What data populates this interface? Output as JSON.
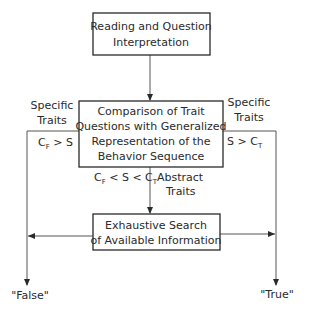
{
  "diagram": {
    "nodes": {
      "reading": {
        "lines": [
          "Reading and Question",
          "Interpretation"
        ]
      },
      "comparison": {
        "lines": [
          "Comparison of Trait",
          "Questions with Generalized",
          "Representation of the",
          "Behavior Sequence"
        ]
      },
      "search": {
        "lines": [
          "Exhaustive Search",
          "of Available Information"
        ]
      }
    },
    "branches": {
      "left": {
        "label_lines": [
          "Specific",
          "Traits"
        ],
        "condition": {
          "main": "C",
          "sub": "F",
          "rest": " > S"
        }
      },
      "right": {
        "label_lines": [
          "Specific",
          "Traits"
        ],
        "condition": {
          "pre": "S > C",
          "sub": "T"
        }
      },
      "down": {
        "condition": {
          "c1": "C",
          "sub1": "F",
          "mid": " < S < C",
          "sub2": "T"
        },
        "label_lines": [
          "Abstract",
          "Traits"
        ]
      }
    },
    "outcomes": {
      "false": "\"False\"",
      "true": "\"True\""
    }
  }
}
